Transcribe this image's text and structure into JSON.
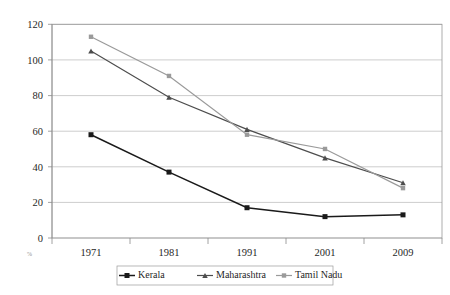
{
  "chart_data": {
    "type": "line",
    "title": "",
    "xlabel": "",
    "ylabel": "",
    "categories": [
      "1971",
      "1981",
      "1991",
      "2001",
      "2009"
    ],
    "ylim": [
      0,
      120
    ],
    "ytick_step": 20,
    "yticks": [
      "0",
      "20",
      "40",
      "60",
      "80",
      "100",
      "120"
    ],
    "grid": true,
    "legend_position": "bottom",
    "series": [
      {
        "name": "Kerala",
        "values": [
          58,
          37,
          17,
          12,
          13
        ],
        "color": "#1a1a1a",
        "marker": "square"
      },
      {
        "name": "Maharashtra",
        "values": [
          105,
          79,
          61,
          45,
          31
        ],
        "color": "#4d4d4d",
        "marker": "triangle"
      },
      {
        "name": "Tamil Nadu",
        "values": [
          113,
          91,
          58,
          50,
          28
        ],
        "color": "#9a9a9a",
        "marker": "square"
      }
    ]
  },
  "axis": {
    "y_tick_labels": [
      "120",
      "100",
      "80",
      "60",
      "40",
      "20",
      "0"
    ],
    "x_tick_labels": [
      "1971",
      "1981",
      "1991",
      "2001",
      "2009"
    ]
  },
  "legend": {
    "items": [
      {
        "label": "Kerala",
        "color": "#1a1a1a",
        "marker": "square"
      },
      {
        "label": "Maharashtra",
        "color": "#4d4d4d",
        "marker": "triangle"
      },
      {
        "label": "Tamil Nadu",
        "color": "#9a9a9a",
        "marker": "square"
      }
    ]
  },
  "corner_mark": "%"
}
